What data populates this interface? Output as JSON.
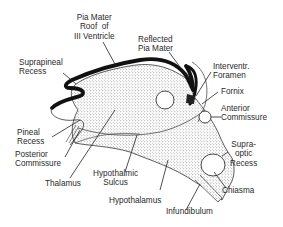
{
  "figure": {
    "labels": {
      "pia_mater_roof": "Pia Mater\nRoof  of\nIII Ventricle",
      "reflected_pia_mater": "Reflected\nPia Mater",
      "suprapineal_recess": "Suprapineal\nRecess",
      "interventricular_foramen": "Interventr.\nForamen",
      "fornix": "Fornix",
      "anterior_commissure": "Anterior\nCommissure",
      "pineal_recess": "Pineal\nRecess",
      "posterior_commissure": "Posterior\nCommissure",
      "thalamus": "Thalamus",
      "hypothalmic_sulcus": "Hypothalmic\nSulcus",
      "hypothalamus": "Hypothalamus",
      "supraoptic_recess": "Supra-\noptic\nRecess",
      "chiasma": "Chiasma",
      "infundibulum": "Infundibulum"
    },
    "colors": {
      "outline": "#111111",
      "stipple": "#555555",
      "text": "#2a2a2a",
      "background": "#ffffff"
    }
  }
}
